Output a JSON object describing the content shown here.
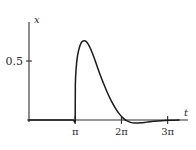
{
  "chart_data": {
    "type": "line",
    "title": "",
    "xlabel": "t",
    "ylabel": "x",
    "xlim": [
      0,
      10.4
    ],
    "ylim": [
      -0.08,
      0.78
    ],
    "grid": false,
    "legend": null,
    "xticks": [
      {
        "value": 3.14159,
        "label": "π"
      },
      {
        "value": 6.28319,
        "label": "2π"
      },
      {
        "value": 9.42478,
        "label": "3π"
      }
    ],
    "yticks": [
      {
        "value": 0.5,
        "label": "0.5"
      }
    ],
    "series": [
      {
        "name": "x(t)",
        "color": "#1a1a1a",
        "points": [
          [
            0.0,
            0.0
          ],
          [
            0.5,
            0.0
          ],
          [
            1.0,
            0.0
          ],
          [
            1.5,
            0.0
          ],
          [
            2.0,
            0.0
          ],
          [
            2.5,
            0.0
          ],
          [
            3.0,
            0.0
          ],
          [
            3.14,
            0.0
          ],
          [
            3.15,
            0.3
          ],
          [
            3.2,
            0.43
          ],
          [
            3.3,
            0.545
          ],
          [
            3.45,
            0.625
          ],
          [
            3.6,
            0.663
          ],
          [
            3.75,
            0.672
          ],
          [
            3.85,
            0.668
          ],
          [
            4.0,
            0.648
          ],
          [
            4.2,
            0.6
          ],
          [
            4.45,
            0.52
          ],
          [
            4.7,
            0.43
          ],
          [
            5.0,
            0.33
          ],
          [
            5.3,
            0.24
          ],
          [
            5.6,
            0.16
          ],
          [
            5.9,
            0.095
          ],
          [
            6.15,
            0.05
          ],
          [
            6.4,
            0.016
          ],
          [
            6.6,
            -0.004
          ],
          [
            6.9,
            -0.02
          ],
          [
            7.2,
            -0.026
          ],
          [
            7.6,
            -0.024
          ],
          [
            8.0,
            -0.018
          ],
          [
            8.5,
            -0.011
          ],
          [
            9.0,
            -0.006
          ],
          [
            9.6,
            -0.003
          ],
          [
            10.2,
            -0.001
          ]
        ]
      }
    ],
    "annotations": [
      {
        "name": "vertical-jump-at-pi",
        "at_x": 3.14159,
        "from_y": 0.0,
        "to_y": 0.3
      }
    ]
  },
  "axes": {
    "x_axis_name": "t-axis",
    "y_axis_name": "x-axis",
    "axis_color": "#2f2f2f"
  }
}
